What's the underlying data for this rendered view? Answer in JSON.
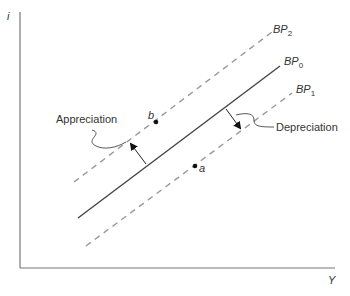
{
  "axes": {
    "y_label": "i",
    "x_label": "Y"
  },
  "curves": [
    {
      "id": "BP2",
      "base": "BP",
      "sub": "2",
      "style": "dashed"
    },
    {
      "id": "BP0",
      "base": "BP",
      "sub": "0",
      "style": "solid"
    },
    {
      "id": "BP1",
      "base": "BP",
      "sub": "1",
      "style": "dashed"
    }
  ],
  "points": [
    {
      "id": "b",
      "label": "b"
    },
    {
      "id": "a",
      "label": "a"
    }
  ],
  "annotations": {
    "appreciation": "Appreciation",
    "depreciation": "Depreciation"
  },
  "colors": {
    "line": "#444444",
    "dashed": "#999999",
    "axis": "#777777"
  }
}
